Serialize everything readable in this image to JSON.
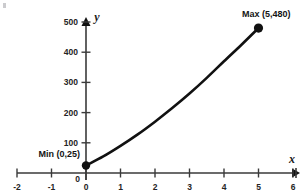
{
  "chart_data": {
    "type": "line",
    "title": "",
    "xlabel": "x",
    "ylabel": "y",
    "xlim": [
      -2,
      6
    ],
    "ylim": [
      0,
      500
    ],
    "grid": false,
    "legend": null,
    "x_ticks": [
      "-2",
      "-1",
      "0",
      "1",
      "2",
      "3",
      "4",
      "5",
      "6"
    ],
    "x_tick_values": [
      -2,
      -1,
      0,
      1,
      2,
      3,
      4,
      5,
      6
    ],
    "y_ticks": [
      "0",
      "100",
      "200",
      "300",
      "400",
      "500"
    ],
    "y_tick_values": [
      0,
      100,
      200,
      300,
      400,
      500
    ],
    "series": [
      {
        "name": "curve",
        "x": [
          0,
          0.5,
          1,
          1.5,
          2,
          2.5,
          3,
          3.5,
          4,
          4.5,
          5
        ],
        "values": [
          25,
          55,
          90,
          128,
          170,
          215,
          263,
          315,
          370,
          424,
          480
        ]
      }
    ],
    "points": [
      {
        "label": "Min (0,25)",
        "x": 0,
        "y": 25,
        "role": "minimum"
      },
      {
        "label": "Max (5,480)",
        "x": 5,
        "y": 480,
        "role": "maximum"
      }
    ],
    "annotations": [
      {
        "name": "min-label",
        "text": "Min (0,25)"
      },
      {
        "name": "max-label",
        "text": "Max (5,480)"
      }
    ],
    "colors": {
      "curve": "#111111",
      "axis": "#3a3a3a",
      "text": "#1a1a1a",
      "background": "#ffffff"
    }
  },
  "axis": {
    "x_name": "x",
    "y_name": "y"
  }
}
